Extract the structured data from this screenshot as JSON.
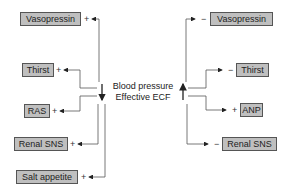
{
  "center": {
    "line1": "Blood pressure",
    "line2": "Effective ECF",
    "left_arrow": "down",
    "right_arrow": "up"
  },
  "left": {
    "items": [
      {
        "label": "Vasopressin",
        "sign": "+"
      },
      {
        "label": "Thirst",
        "sign": "+"
      },
      {
        "label": "RAS",
        "sign": "+"
      },
      {
        "label": "Renal SNS",
        "sign": "+"
      },
      {
        "label": "Salt appetite",
        "sign": "+"
      }
    ]
  },
  "right": {
    "items": [
      {
        "label": "Vasopressin",
        "sign": "−"
      },
      {
        "label": "Thirst",
        "sign": "−"
      },
      {
        "label": "ANP",
        "sign": "+"
      },
      {
        "label": "Renal SNS",
        "sign": "−"
      }
    ]
  },
  "colors": {
    "box_fill": "#bfbfbf",
    "box_border": "#555555",
    "line": "#444444"
  }
}
